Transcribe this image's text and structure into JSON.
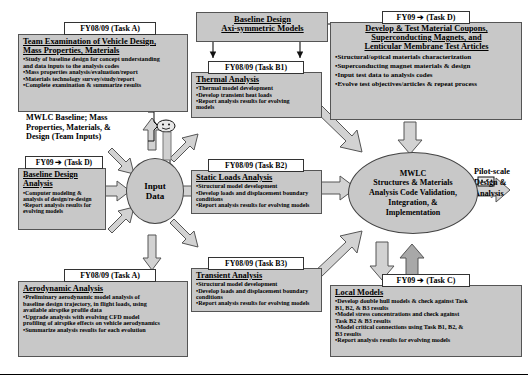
{
  "diagram": {
    "colors": {
      "box_fill": "#c8c8c8",
      "box_border": "#555555",
      "tag_fill": "#ffffff",
      "arrow_fill": "#d0d0d0",
      "arrow_stroke": "#555555",
      "text": "#000000"
    }
  },
  "baseline_models": {
    "line1": "Baseline Design",
    "line2": "Axi-symmetric Models"
  },
  "task_a_vehicle": {
    "tag": "FY08/09 (Task A)",
    "title_line1": "Team Examination of Vehicle Design,",
    "title_line2": "Mass Properties, Materials",
    "bullets": [
      "Study of  baseline design for concept understanding",
      "and data inputs to the analysis codes",
      "Mass properties analysis/evaluation/report",
      "Materials technology survey/study/report",
      "Complete examination & summarize results"
    ],
    "bullet_flags": [
      true,
      false,
      true,
      true,
      true
    ]
  },
  "team_inputs_note": {
    "line1": "MWLC Baseline; Mass",
    "line2": "Properties, Materials, &",
    "line3": "Design (Team Inputs)"
  },
  "task_d_baseline": {
    "tag": "FY09 ➔ (Task D)",
    "title_line1": "Baseline Design",
    "title_line2": "Analysis",
    "bullets": [
      "Computer modeling &",
      "analysis of design/re-design",
      "Report analysis results for",
      "evolving models"
    ],
    "bullet_flags": [
      true,
      false,
      true,
      false
    ]
  },
  "task_a_aero": {
    "tag": "FY08/09 (Task A)",
    "title_line1": "Aerodynamic Analysis",
    "bullets": [
      "Preliminary aerodynamic model analysis of",
      "baseline design trajectory, in flight loads, using",
      "available airspike profile data",
      "Upgrade analysis with evolving CFD model",
      "profiling of airspike effects on vehicle aerodynamics",
      "Summarize analysis results for each evolution"
    ],
    "bullet_flags": [
      true,
      false,
      false,
      true,
      false,
      true
    ]
  },
  "task_b1_thermal": {
    "tag": "FY08/09 (Task B1)",
    "title_line1": "Thermal Analysis",
    "bullets": [
      "Thermal model development",
      "Develop transient heat loads",
      "Report analysis results for evolving",
      "models"
    ],
    "bullet_flags": [
      true,
      true,
      true,
      false
    ]
  },
  "task_b2_static": {
    "tag": "FY08/09 (Task B2)",
    "title_line1": "Static Loads Analysis",
    "bullets": [
      "Structural model development",
      "Develop loads and displacement boundary",
      "conditions",
      "Report analysis results for evolving models"
    ],
    "bullet_flags": [
      true,
      true,
      false,
      true
    ]
  },
  "task_b3_transient": {
    "tag": "FY08/09 (Task B3)",
    "title_line1": "Transient Analysis",
    "bullets": [
      "Structural model development",
      "Develop loads and displacement boundary",
      "conditions",
      "Report analysis results for evolving models"
    ],
    "bullet_flags": [
      true,
      true,
      false,
      true
    ]
  },
  "task_d_materials": {
    "tag": "FY09 ➔ (Task D)",
    "title_line1": "Develop & Test Material Coupons,",
    "title_line2": "Superconducting Magnets, and",
    "title_line3": "Lenticular Membrane Test Articles",
    "bullets": [
      "Structural/optical materials characterization",
      "Superconducting magnet materials & design",
      "Input test data to analysis codes",
      "Evolve test objectives/articles & repeat process"
    ],
    "bullet_flags": [
      true,
      true,
      true,
      true
    ]
  },
  "task_c_local": {
    "tag": "FY09 ➔ (Task C)",
    "title_line1": "Local Models",
    "bullets": [
      "Develop double hull models & check against Task",
      "B1, B2, & B3 results",
      "Model stress concentrations  and check against",
      "Task B2 & B3 results",
      "Model critical connections using Task B1, B2, &",
      "B3  results",
      "Report analysis results for evolving models"
    ],
    "bullet_flags": [
      true,
      false,
      true,
      false,
      true,
      false,
      true
    ]
  },
  "input_data_node": {
    "line1": "Input",
    "line2": "Data"
  },
  "mwlc_node": {
    "line1": "MWLC",
    "line2": "Structures & Materials",
    "line3": "Analysis Code Validation,",
    "line4": "Integration, &",
    "line5": "Implementation"
  },
  "pilot_scale": {
    "line1": "Pilot-scale",
    "line2": "Design &",
    "line3": "Analysis"
  }
}
